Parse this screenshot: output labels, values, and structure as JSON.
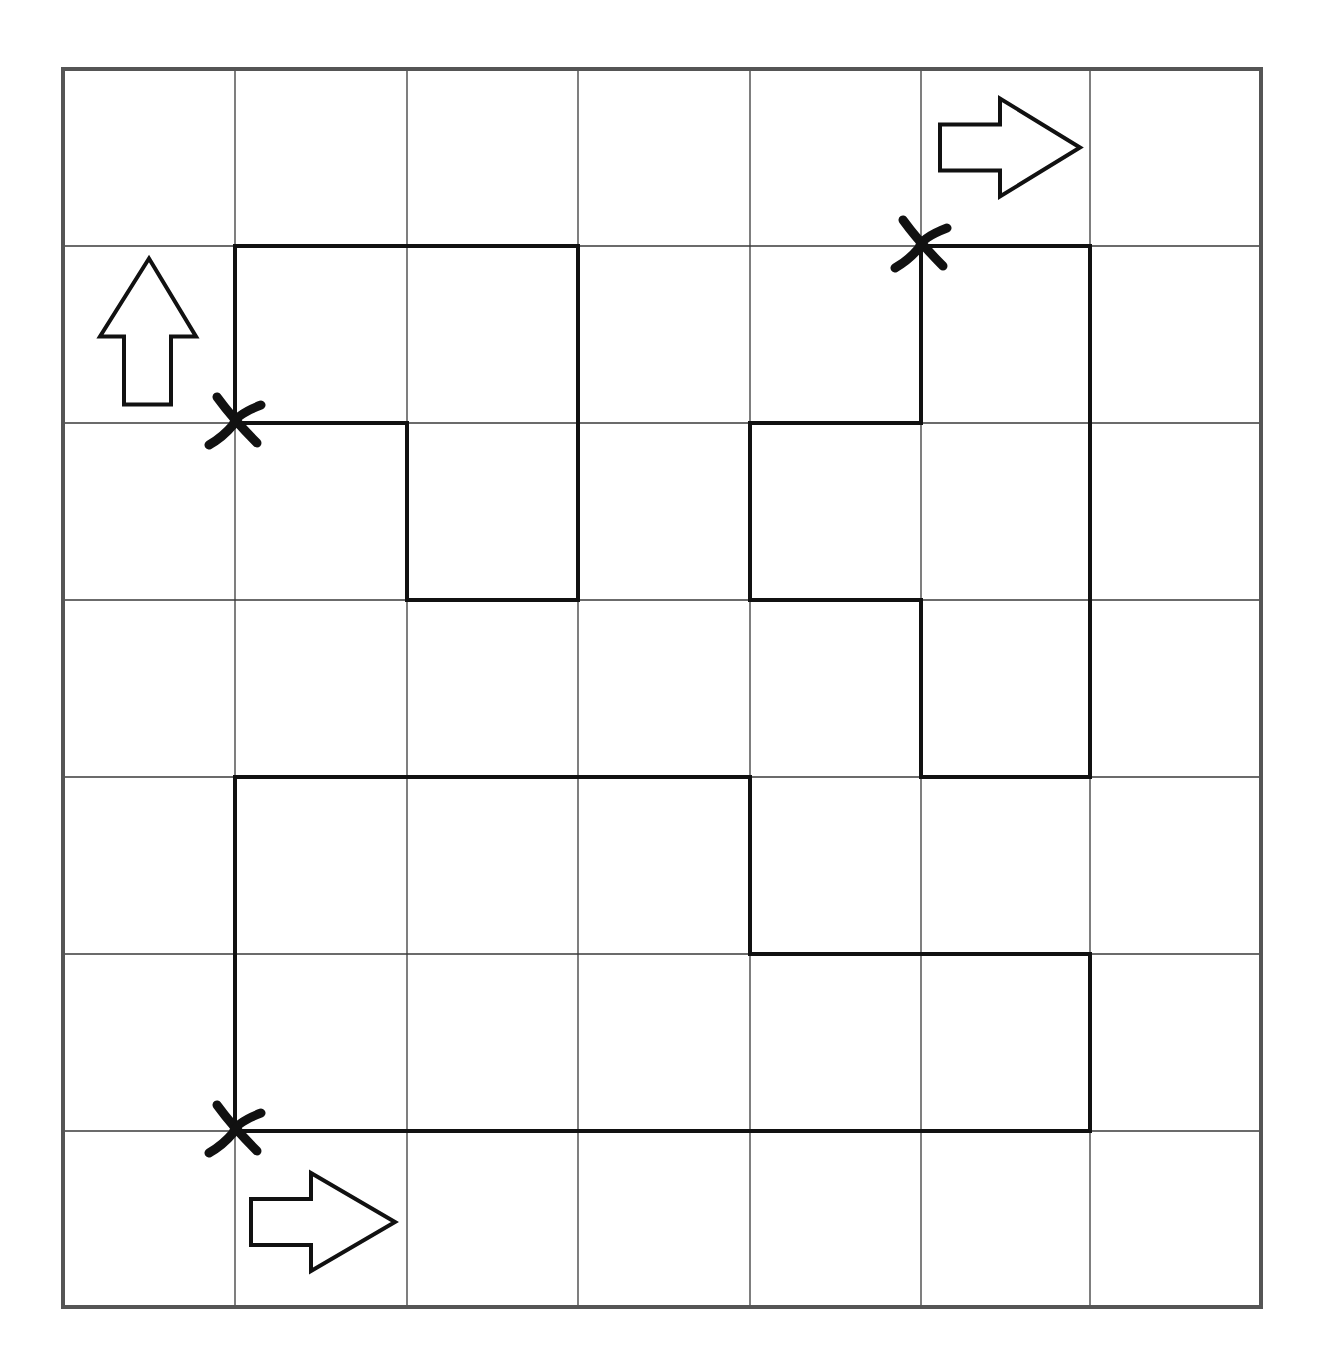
{
  "puzzle": {
    "type": "grid-path-puzzle",
    "rows": 7,
    "cols": 7,
    "colors": {
      "background": "#ffffff",
      "border": "#555555",
      "grid_line": "#3a3a3a",
      "path": "#111111"
    },
    "column_edges_px": [
      63,
      235,
      407,
      578,
      750,
      921,
      1090,
      1261
    ],
    "row_edges_px": [
      69,
      246,
      423,
      600,
      777,
      954,
      1131,
      1307
    ],
    "paths": [
      {
        "name": "path-top-left",
        "start_marker": "cross",
        "start_direction": "up",
        "nodes": [
          [
            1,
            2
          ],
          [
            1,
            1
          ],
          [
            3,
            1
          ],
          [
            3,
            3
          ],
          [
            2,
            3
          ],
          [
            2,
            2
          ],
          [
            1,
            2
          ]
        ]
      },
      {
        "name": "path-top-right",
        "start_marker": "cross",
        "start_direction": "right",
        "nodes": [
          [
            5,
            1
          ],
          [
            6,
            1
          ],
          [
            6,
            4
          ],
          [
            5,
            4
          ],
          [
            5,
            3
          ],
          [
            4,
            3
          ],
          [
            4,
            2
          ],
          [
            5,
            2
          ],
          [
            5,
            1
          ]
        ]
      },
      {
        "name": "path-bottom",
        "start_marker": "cross",
        "start_direction": "right",
        "nodes": [
          [
            1,
            6
          ],
          [
            1,
            4
          ],
          [
            4,
            4
          ],
          [
            4,
            5
          ],
          [
            6,
            5
          ],
          [
            6,
            6
          ],
          [
            1,
            6
          ]
        ]
      }
    ],
    "markers": [
      {
        "type": "cross",
        "node": [
          1,
          2
        ],
        "label": "start-marker-top-left"
      },
      {
        "type": "cross",
        "node": [
          5,
          1
        ],
        "label": "start-marker-top-right"
      },
      {
        "type": "cross",
        "node": [
          1,
          6
        ],
        "label": "start-marker-bottom"
      }
    ],
    "arrows": [
      {
        "direction": "up",
        "cell": [
          0,
          1
        ],
        "label": "arrow-up-top-left"
      },
      {
        "direction": "right",
        "cell": [
          5,
          0
        ],
        "label": "arrow-right-top-right"
      },
      {
        "direction": "right",
        "cell": [
          1,
          6
        ],
        "label": "arrow-right-bottom"
      }
    ]
  }
}
